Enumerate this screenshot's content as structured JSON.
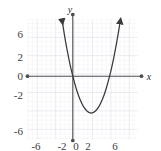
{
  "figure": {
    "title": "",
    "axis_labels": {
      "x": "x",
      "y": "y"
    },
    "colors": {
      "axis": "#4d4d4d",
      "curve": "#3a3a3a",
      "grid_minor": "#e8e6ef",
      "grid_major": "#d8d5e2",
      "background": "#ffffff",
      "text": "#3c3c3c"
    }
  },
  "chart_data": {
    "type": "line",
    "title": "",
    "xlabel": "x",
    "ylabel": "y",
    "xlim": [
      -7.2,
      7.4
    ],
    "ylim": [
      -8.2,
      7.2
    ],
    "grid": true,
    "grid_step_minor": 0.5,
    "grid_step_major": 2,
    "legend": "none",
    "xticks": [
      -6,
      -2,
      0,
      2,
      6
    ],
    "xtick_labels": [
      "-6",
      "-2",
      "0",
      "2",
      "6"
    ],
    "yticks": [
      6,
      2,
      0,
      -2,
      -6
    ],
    "ytick_labels": [
      "6",
      "2",
      "0",
      "-2",
      "-6"
    ],
    "series": [
      {
        "name": "parabola",
        "kind": "quadratic",
        "equation": "y = (x - 2)^2 - 4",
        "vertex": [
          2,
          -4
        ],
        "roots": [
          0,
          4
        ],
        "opens": "up",
        "arrow_start": [
          -1.15,
          6
        ],
        "arrow_end": [
          5.15,
          6
        ],
        "x": [
          -1.15,
          -0.8,
          -0.4,
          0,
          0.4,
          0.8,
          1.2,
          1.6,
          2,
          2.4,
          2.8,
          3.2,
          3.6,
          4,
          4.4,
          4.8,
          5.15
        ],
        "y": [
          6.0,
          3.84,
          1.76,
          0,
          -1.44,
          -2.56,
          -3.36,
          -3.84,
          -4,
          -3.84,
          -3.36,
          -2.56,
          -1.44,
          0,
          1.76,
          3.84,
          5.93
        ]
      }
    ]
  }
}
